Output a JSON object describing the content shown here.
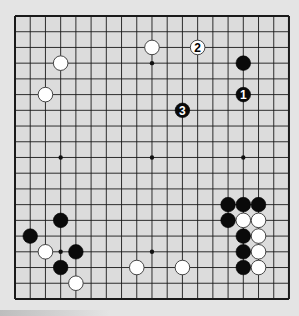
{
  "board": {
    "size": 19,
    "origin_x": 15,
    "origin_y": 16,
    "spacing_x": 15.22,
    "spacing_y": 15.72,
    "background": "#dcdcdc",
    "line_color": "#1a1a1a",
    "star_points": [
      [
        3,
        3
      ],
      [
        9,
        3
      ],
      [
        15,
        3
      ],
      [
        3,
        9
      ],
      [
        9,
        9
      ],
      [
        15,
        9
      ],
      [
        3,
        15
      ],
      [
        9,
        15
      ],
      [
        15,
        15
      ]
    ]
  },
  "stones": [
    {
      "color": "white",
      "col": 3,
      "row": 3,
      "label": ""
    },
    {
      "color": "white",
      "col": 2,
      "row": 5,
      "label": ""
    },
    {
      "color": "white",
      "col": 9,
      "row": 2,
      "label": ""
    },
    {
      "color": "white",
      "col": 12,
      "row": 2,
      "label": "2"
    },
    {
      "color": "black",
      "col": 15,
      "row": 3,
      "label": ""
    },
    {
      "color": "black",
      "col": 15,
      "row": 5,
      "label": "1"
    },
    {
      "color": "black",
      "col": 11,
      "row": 6,
      "label": "3"
    },
    {
      "color": "black",
      "col": 3,
      "row": 13,
      "label": ""
    },
    {
      "color": "black",
      "col": 1,
      "row": 14,
      "label": ""
    },
    {
      "color": "white",
      "col": 2,
      "row": 15,
      "label": ""
    },
    {
      "color": "black",
      "col": 4,
      "row": 15,
      "label": ""
    },
    {
      "color": "black",
      "col": 3,
      "row": 16,
      "label": ""
    },
    {
      "color": "white",
      "col": 4,
      "row": 17,
      "label": ""
    },
    {
      "color": "white",
      "col": 8,
      "row": 16,
      "label": ""
    },
    {
      "color": "white",
      "col": 11,
      "row": 16,
      "label": ""
    },
    {
      "color": "black",
      "col": 14,
      "row": 12,
      "label": ""
    },
    {
      "color": "black",
      "col": 15,
      "row": 12,
      "label": ""
    },
    {
      "color": "black",
      "col": 16,
      "row": 12,
      "label": ""
    },
    {
      "color": "black",
      "col": 14,
      "row": 13,
      "label": ""
    },
    {
      "color": "white",
      "col": 15,
      "row": 13,
      "label": ""
    },
    {
      "color": "white",
      "col": 16,
      "row": 13,
      "label": ""
    },
    {
      "color": "black",
      "col": 15,
      "row": 14,
      "label": ""
    },
    {
      "color": "white",
      "col": 16,
      "row": 14,
      "label": ""
    },
    {
      "color": "black",
      "col": 15,
      "row": 15,
      "label": ""
    },
    {
      "color": "white",
      "col": 16,
      "row": 15,
      "label": ""
    },
    {
      "color": "black",
      "col": 15,
      "row": 16,
      "label": ""
    },
    {
      "color": "white",
      "col": 16,
      "row": 16,
      "label": ""
    }
  ]
}
